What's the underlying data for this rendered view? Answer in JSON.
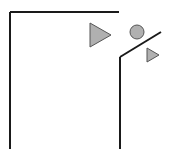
{
  "diagram": {
    "background": "#ffffff",
    "stroke_color": "#1a1a1a",
    "fill_color": "#b0b0b0",
    "wall_left": {
      "x1": 10,
      "y1": 12,
      "x2": 10,
      "y2": 149
    },
    "wall_top": {
      "x1": 10,
      "y1": 12,
      "x2": 119,
      "y2": 12
    },
    "wall_right": {
      "x1": 120,
      "y1": 57,
      "x2": 120,
      "y2": 149
    },
    "slope": {
      "x1": 120,
      "y1": 57,
      "x2": 161,
      "y2": 32
    },
    "triangle_large": {
      "points": "90,23 90,47 111,35"
    },
    "circle": {
      "cx": 137,
      "cy": 32,
      "r": 7
    },
    "triangle_small": {
      "points": "147,48 147,62 159,55"
    }
  }
}
